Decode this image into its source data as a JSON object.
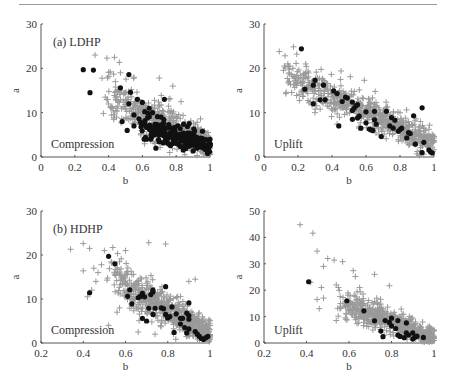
{
  "figure": {
    "colors": {
      "gray_marker": "#9a9a9a",
      "black_marker": "#111111",
      "axis": "#555555",
      "text": "#333333"
    }
  },
  "chart_data": [
    {
      "type": "scatter",
      "panel": "top-left",
      "title": "(a) LDHP",
      "annotation": "Compression",
      "xlabel": "b",
      "ylabel": "a",
      "xlim": [
        0,
        1
      ],
      "ylim": [
        0,
        30
      ],
      "xticks": [
        "0",
        "0.2",
        "0.4",
        "0.6",
        "0.8",
        "1"
      ],
      "xtick_values": [
        0,
        0.2,
        0.4,
        0.6,
        0.8,
        1
      ],
      "yticks": [
        "0",
        "10",
        "20",
        "30"
      ],
      "ytick_values": [
        0,
        10,
        20,
        30
      ],
      "grid": false,
      "series": [
        {
          "name": "all samples",
          "marker": "plus",
          "color": "#9a9a9a",
          "cloud": {
            "b_range": [
              0.38,
              1.0
            ],
            "a_at_b_low": 14,
            "a_at_b_high": 2.5,
            "spread": 3.0,
            "count": 520
          },
          "values": [
            [
              0.32,
              23
            ],
            [
              0.39,
              22.3
            ],
            [
              0.41,
              19.2
            ],
            [
              0.38,
              13.5
            ],
            [
              0.44,
              17
            ],
            [
              0.47,
              19
            ],
            [
              0.55,
              18
            ],
            [
              0.7,
              17.8
            ],
            [
              0.78,
              16
            ],
            [
              0.43,
              8.5
            ],
            [
              0.42,
              11
            ]
          ]
        },
        {
          "name": "selected",
          "marker": "dot",
          "color": "#111111",
          "cloud": {
            "b_range": [
              0.6,
              1.0
            ],
            "a_at_b_low": 7,
            "a_at_b_high": 2.5,
            "spread": 1.6,
            "count": 180
          },
          "values": [
            [
              0.25,
              19.7
            ],
            [
              0.31,
              19.6
            ],
            [
              0.29,
              14.5
            ],
            [
              0.52,
              18.6
            ],
            [
              0.47,
              15.6
            ],
            [
              0.53,
              14.6
            ],
            [
              0.52,
              12
            ],
            [
              0.57,
              13
            ],
            [
              0.6,
              12.3
            ],
            [
              0.64,
              11
            ],
            [
              0.55,
              9.5
            ],
            [
              0.58,
              8.6
            ],
            [
              0.48,
              8
            ],
            [
              0.59,
              7.8
            ],
            [
              0.62,
              7
            ],
            [
              0.55,
              7
            ],
            [
              0.66,
              10
            ],
            [
              0.71,
              9
            ],
            [
              0.73,
              13
            ],
            [
              0.51,
              6
            ],
            [
              0.68,
              2
            ],
            [
              0.76,
              2.8
            ]
          ]
        }
      ]
    },
    {
      "type": "scatter",
      "panel": "top-right",
      "title": "",
      "annotation": "Uplift",
      "xlabel": "b",
      "ylabel": "a",
      "xlim": [
        0,
        1
      ],
      "ylim": [
        0,
        30
      ],
      "xticks": [
        "0",
        "0.2",
        "0.4",
        "0.6",
        "0.8",
        "1"
      ],
      "xtick_values": [
        0,
        0.2,
        0.4,
        0.6,
        0.8,
        1
      ],
      "yticks": [
        "0",
        "10",
        "20",
        "30"
      ],
      "ytick_values": [
        0,
        10,
        20,
        30
      ],
      "grid": false,
      "series": [
        {
          "name": "all samples",
          "marker": "plus",
          "color": "#9a9a9a",
          "cloud": {
            "b_range": [
              0.12,
              1.0
            ],
            "a_at_b_low": 19,
            "a_at_b_high": 3,
            "spread": 2.4,
            "count": 650
          },
          "values": [
            [
              0.09,
              23.8
            ],
            [
              0.14,
              21
            ],
            [
              0.17,
              20
            ],
            [
              0.15,
              17
            ],
            [
              0.45,
              17.5
            ],
            [
              0.59,
              17.3
            ],
            [
              0.92,
              8
            ],
            [
              0.95,
              6
            ],
            [
              0.3,
              10
            ]
          ]
        },
        {
          "name": "selected",
          "marker": "dot",
          "color": "#111111",
          "values": [
            [
              0.22,
              24.4
            ],
            [
              0.24,
              15.3
            ],
            [
              0.29,
              16.2
            ],
            [
              0.3,
              17.3
            ],
            [
              0.33,
              12.9
            ],
            [
              0.29,
              12
            ],
            [
              0.36,
              12.9
            ],
            [
              0.35,
              16.2
            ],
            [
              0.41,
              14.9
            ],
            [
              0.43,
              14.3
            ],
            [
              0.46,
              12.5
            ],
            [
              0.48,
              13.5
            ],
            [
              0.49,
              13.3
            ],
            [
              0.44,
              7
            ],
            [
              0.52,
              10.5
            ],
            [
              0.52,
              12.4
            ],
            [
              0.53,
              11
            ],
            [
              0.54,
              11.5
            ],
            [
              0.55,
              11.8
            ],
            [
              0.56,
              9.2
            ],
            [
              0.52,
              8.5
            ],
            [
              0.55,
              8.8
            ],
            [
              0.57,
              6.5
            ],
            [
              0.6,
              10.2
            ],
            [
              0.6,
              7.7
            ],
            [
              0.62,
              6.3
            ],
            [
              0.63,
              6.1
            ],
            [
              0.64,
              6
            ],
            [
              0.65,
              8.4
            ],
            [
              0.65,
              10.3
            ],
            [
              0.66,
              7.4
            ],
            [
              0.69,
              4.6
            ],
            [
              0.72,
              10.3
            ],
            [
              0.74,
              7
            ],
            [
              0.75,
              8.9
            ],
            [
              0.76,
              6.5
            ],
            [
              0.77,
              8.3
            ],
            [
              0.79,
              5.8
            ],
            [
              0.8,
              6.2
            ],
            [
              0.81,
              6.5
            ],
            [
              0.84,
              4.3
            ],
            [
              0.85,
              5.5
            ],
            [
              0.86,
              5.3
            ],
            [
              0.88,
              9.3
            ],
            [
              0.89,
              2.9
            ],
            [
              0.93,
              11.1
            ],
            [
              0.93,
              1
            ],
            [
              0.94,
              3.3
            ],
            [
              0.97,
              1.6
            ],
            [
              0.98,
              1.1
            ],
            [
              0.99,
              0.9
            ]
          ]
        }
      ]
    },
    {
      "type": "scatter",
      "panel": "bottom-left",
      "title": "(b) HDHP",
      "annotation": "Compression",
      "xlabel": "b",
      "ylabel": "a",
      "xlim": [
        0.2,
        1
      ],
      "ylim": [
        0,
        30
      ],
      "xticks": [
        "0.2",
        "0.4",
        "0.6",
        "0.8",
        "1"
      ],
      "xtick_values": [
        0.2,
        0.4,
        0.6,
        0.8,
        1
      ],
      "yticks": [
        "0",
        "10",
        "20",
        "30"
      ],
      "ytick_values": [
        0,
        10,
        20,
        30
      ],
      "grid": false,
      "series": [
        {
          "name": "all samples",
          "marker": "plus",
          "color": "#9a9a9a",
          "cloud": {
            "b_range": [
              0.52,
              1.0
            ],
            "a_at_b_low": 15,
            "a_at_b_high": 2,
            "spread": 2.6,
            "count": 600
          },
          "values": [
            [
              0.34,
              21.3
            ],
            [
              0.4,
              22.6
            ],
            [
              0.43,
              21.5
            ],
            [
              0.4,
              16.4
            ],
            [
              0.45,
              17
            ],
            [
              0.47,
              16
            ],
            [
              0.44,
              12
            ],
            [
              0.46,
              14
            ],
            [
              0.5,
              21
            ],
            [
              0.54,
              21.7
            ],
            [
              0.6,
              21
            ],
            [
              0.71,
              22.8
            ],
            [
              0.79,
              22.5
            ],
            [
              0.93,
              14.5
            ],
            [
              0.9,
              14
            ],
            [
              0.56,
              7
            ],
            [
              0.52,
              4
            ],
            [
              0.66,
              2.5
            ],
            [
              0.74,
              2
            ],
            [
              0.95,
              5
            ],
            [
              0.42,
              10.5
            ]
          ]
        },
        {
          "name": "selected",
          "marker": "dot",
          "color": "#111111",
          "values": [
            [
              0.43,
              11.4
            ],
            [
              0.52,
              19.7
            ],
            [
              0.55,
              18
            ],
            [
              0.62,
              12.1
            ],
            [
              0.61,
              10.6
            ],
            [
              0.63,
              8.9
            ],
            [
              0.66,
              10.3
            ],
            [
              0.67,
              10.6
            ],
            [
              0.68,
              11.3
            ],
            [
              0.69,
              10.5
            ],
            [
              0.72,
              11
            ],
            [
              0.73,
              11.6
            ],
            [
              0.73,
              12
            ],
            [
              0.71,
              7.9
            ],
            [
              0.74,
              7.9
            ],
            [
              0.73,
              6.5
            ],
            [
              0.68,
              5.6
            ],
            [
              0.7,
              5
            ],
            [
              0.77,
              8
            ],
            [
              0.78,
              7.8
            ],
            [
              0.79,
              12.8
            ],
            [
              0.79,
              6.5
            ],
            [
              0.8,
              5.7
            ],
            [
              0.81,
              6
            ],
            [
              0.82,
              8.2
            ],
            [
              0.84,
              6.6
            ],
            [
              0.86,
              5.6
            ],
            [
              0.87,
              5.6
            ],
            [
              0.86,
              4.3
            ],
            [
              0.88,
              3.5
            ],
            [
              0.89,
              6.8
            ],
            [
              0.83,
              2.4
            ],
            [
              0.89,
              2.3
            ],
            [
              0.9,
              9.1
            ],
            [
              0.9,
              6.2
            ],
            [
              0.9,
              5.4
            ],
            [
              0.9,
              3.2
            ],
            [
              0.93,
              2.6
            ],
            [
              0.94,
              2
            ],
            [
              0.95,
              1.5
            ],
            [
              0.96,
              1
            ],
            [
              0.97,
              0.8
            ],
            [
              0.98,
              1.2
            ],
            [
              0.99,
              1.5
            ]
          ]
        }
      ]
    },
    {
      "type": "scatter",
      "panel": "bottom-right",
      "title": "",
      "annotation": "Uplift",
      "xlabel": "b",
      "ylabel": "a",
      "xlim": [
        0.2,
        1
      ],
      "ylim": [
        0,
        50
      ],
      "xticks": [
        "0.2",
        "0.4",
        "0.6",
        "0.8",
        "1"
      ],
      "xtick_values": [
        0.2,
        0.4,
        0.6,
        0.8,
        1
      ],
      "yticks": [
        "0",
        "10",
        "20",
        "30",
        "40",
        "50"
      ],
      "ytick_values": [
        0,
        10,
        20,
        30,
        40,
        50
      ],
      "grid": false,
      "series": [
        {
          "name": "all samples",
          "marker": "plus",
          "color": "#9a9a9a",
          "cloud": {
            "b_range": [
              0.55,
              1.0
            ],
            "a_at_b_low": 16,
            "a_at_b_high": 2,
            "spread": 3.0,
            "count": 560
          },
          "values": [
            [
              0.37,
              44.8
            ],
            [
              0.43,
              41.6
            ],
            [
              0.45,
              34.8
            ],
            [
              0.5,
              32
            ],
            [
              0.48,
              29
            ],
            [
              0.53,
              31.4
            ],
            [
              0.57,
              30.8
            ],
            [
              0.45,
              16.5
            ],
            [
              0.46,
              13
            ],
            [
              0.47,
              21
            ],
            [
              0.48,
              17
            ],
            [
              0.42,
              23
            ],
            [
              0.72,
              26
            ],
            [
              0.79,
              21.7
            ],
            [
              0.62,
              27.4
            ],
            [
              0.63,
              25.2
            ],
            [
              0.65,
              21
            ],
            [
              0.54,
              22
            ],
            [
              0.55,
              21
            ],
            [
              0.56,
              15
            ],
            [
              0.54,
              8.5
            ],
            [
              0.67,
              15
            ]
          ]
        },
        {
          "name": "selected",
          "marker": "dot",
          "color": "#111111",
          "values": [
            [
              0.41,
              23.2
            ],
            [
              0.59,
              16
            ],
            [
              0.67,
              12.2
            ],
            [
              0.72,
              8.4
            ],
            [
              0.75,
              4.5
            ],
            [
              0.76,
              2.4
            ],
            [
              0.77,
              8.5
            ],
            [
              0.79,
              7.8
            ],
            [
              0.8,
              9.4
            ],
            [
              0.8,
              6.5
            ],
            [
              0.82,
              5.5
            ],
            [
              0.83,
              3
            ],
            [
              0.84,
              2.5
            ],
            [
              0.83,
              8.5
            ],
            [
              0.86,
              2
            ],
            [
              0.87,
              7.6
            ],
            [
              0.87,
              3.8
            ],
            [
              0.88,
              3
            ],
            [
              0.9,
              1.5
            ],
            [
              0.9,
              3.8
            ],
            [
              0.91,
              2.2
            ],
            [
              0.92,
              2.6
            ],
            [
              0.95,
              2.1
            ]
          ]
        }
      ]
    }
  ]
}
